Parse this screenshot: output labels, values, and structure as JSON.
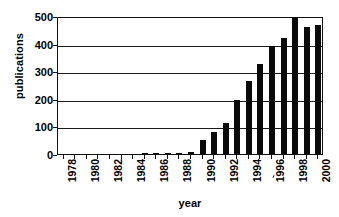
{
  "chart_data": {
    "type": "bar",
    "title": "",
    "xlabel": "year",
    "ylabel": "publications",
    "categories": [
      "1978",
      "1979",
      "1980",
      "1981",
      "1982",
      "1983",
      "1984",
      "1985",
      "1986",
      "1987",
      "1988",
      "1989",
      "1990",
      "1991",
      "1992",
      "1993",
      "1994",
      "1995",
      "1996",
      "1997",
      "1998",
      "1999",
      "2000"
    ],
    "values": [
      0,
      0,
      0,
      0,
      0,
      0,
      0,
      1,
      2,
      5,
      4,
      9,
      50,
      80,
      112,
      195,
      265,
      325,
      390,
      420,
      495,
      460,
      468
    ],
    "xtick_labels": [
      "1978",
      "1980",
      "1982",
      "1984",
      "1986",
      "1988",
      "1990",
      "1992",
      "1994",
      "1996",
      "1998",
      "2000"
    ],
    "ytick_labels": [
      "0",
      "100",
      "200",
      "300",
      "400",
      "500"
    ],
    "ytick_values": [
      0,
      100,
      200,
      300,
      400,
      500
    ],
    "ylim": [
      0,
      500
    ],
    "xlim": [
      "1978",
      "2000"
    ],
    "grid": "horizontal",
    "legend": "none",
    "bar_color": "#0a0a0a",
    "axis_color": "#111111",
    "background_color": "#ffffff"
  }
}
